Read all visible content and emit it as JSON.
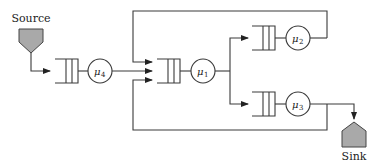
{
  "diagram": {
    "type": "queueing-network",
    "source": {
      "label": "Source",
      "color": "#a9a9a9"
    },
    "sink": {
      "label": "Sink",
      "color": "#a9a9a9"
    },
    "servers": [
      {
        "id": "s4",
        "symbol": "μ",
        "subscript": "4"
      },
      {
        "id": "s1",
        "symbol": "μ",
        "subscript": "1"
      },
      {
        "id": "s2",
        "symbol": "μ",
        "subscript": "2"
      },
      {
        "id": "s3",
        "symbol": "μ",
        "subscript": "3"
      }
    ],
    "edges": [
      {
        "from": "Source",
        "to": "queue-4"
      },
      {
        "from": "s4",
        "to": "queue-1"
      },
      {
        "from": "s1",
        "to": "queue-2"
      },
      {
        "from": "s1",
        "to": "queue-3"
      },
      {
        "from": "s2",
        "to": "queue-1",
        "path": "feedback-top"
      },
      {
        "from": "s3",
        "to": "queue-1",
        "path": "feedback-bottom"
      },
      {
        "from": "s3",
        "to": "Sink"
      }
    ]
  }
}
